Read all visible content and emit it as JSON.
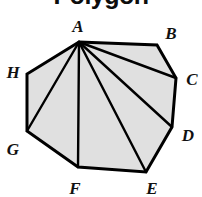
{
  "figure": {
    "title": "Polygon",
    "title_clipped": true,
    "shape_name": "octagon",
    "background_color": "#ffffff",
    "fill_color": "#e0e0e0",
    "stroke_color": "#000000",
    "stroke_width": 3,
    "diagonal_stroke_width": 2.4,
    "label_color": "#111111",
    "apex_vertex": "A",
    "polygon_path": "79,42 157,45 176,78 172,127 146,172 78,167 27,131 27,74",
    "vertices": [
      {
        "id": "A",
        "label": "A",
        "x": 79,
        "y": 42,
        "label_x": 78,
        "label_y": 26
      },
      {
        "id": "B",
        "label": "B",
        "x": 157,
        "y": 45,
        "label_x": 171,
        "label_y": 33
      },
      {
        "id": "C",
        "label": "C",
        "x": 176,
        "y": 78,
        "label_x": 192,
        "label_y": 79
      },
      {
        "id": "D",
        "label": "D",
        "x": 172,
        "y": 127,
        "label_x": 188,
        "label_y": 135
      },
      {
        "id": "E",
        "label": "E",
        "x": 146,
        "y": 172,
        "label_x": 152,
        "label_y": 188
      },
      {
        "id": "F",
        "label": "F",
        "x": 78,
        "y": 167,
        "label_x": 75,
        "label_y": 188
      },
      {
        "id": "G",
        "label": "G",
        "x": 27,
        "y": 131,
        "label_x": 13,
        "label_y": 149
      },
      {
        "id": "H",
        "label": "H",
        "x": 27,
        "y": 74,
        "label_x": 13,
        "label_y": 72
      }
    ],
    "diagonals": [
      {
        "from": "A",
        "to": "C",
        "x1": 79,
        "y1": 42,
        "x2": 176,
        "y2": 78
      },
      {
        "from": "A",
        "to": "D",
        "x1": 79,
        "y1": 42,
        "x2": 172,
        "y2": 127
      },
      {
        "from": "A",
        "to": "E",
        "x1": 79,
        "y1": 42,
        "x2": 146,
        "y2": 172
      },
      {
        "from": "A",
        "to": "F",
        "x1": 79,
        "y1": 42,
        "x2": 78,
        "y2": 167
      },
      {
        "from": "A",
        "to": "G",
        "x1": 79,
        "y1": 42,
        "x2": 27,
        "y2": 131
      }
    ],
    "triangle_count": 6
  }
}
